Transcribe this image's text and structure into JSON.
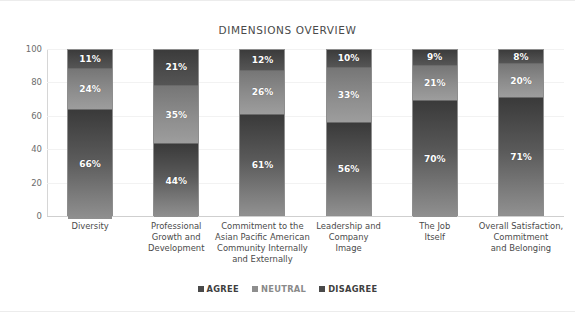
{
  "chart_data": {
    "type": "bar",
    "subtype": "stacked-100-percent-column",
    "title": "DIMENSIONS OVERVIEW",
    "xlabel": "",
    "ylabel": "",
    "ylim": [
      0,
      100
    ],
    "yticks": [
      0,
      20,
      40,
      60,
      80,
      100
    ],
    "grid": true,
    "legend_position": "bottom",
    "categories": [
      "Diversity",
      "Professional Growth and Development",
      "Commitment to the Asian Pacific American Community Internally and Externally",
      "Leadership and Company Image",
      "The Job Itself",
      "Overall Satisfaction, Commitment and Belonging"
    ],
    "category_lines": [
      [
        "Diversity"
      ],
      [
        "Professional",
        "Growth and",
        "Development"
      ],
      [
        "Commitment to the",
        "Asian Pacific American",
        "Community Internally",
        "and Externally"
      ],
      [
        "Leadership and",
        "Company",
        "Image"
      ],
      [
        "The Job",
        "Itself"
      ],
      [
        "Overall Satisfaction,",
        "Commitment",
        "and Belonging"
      ]
    ],
    "series": [
      {
        "name": "AGREE",
        "color": "#5a5a5a",
        "values": [
          66,
          44,
          61,
          56,
          70,
          71
        ],
        "labels": [
          "66%",
          "44%",
          "61%",
          "56%",
          "70%",
          "71%"
        ]
      },
      {
        "name": "NEUTRAL",
        "color": "#8b8b8b",
        "values": [
          24,
          35,
          26,
          33,
          21,
          20
        ],
        "labels": [
          "24%",
          "35%",
          "26%",
          "33%",
          "21%",
          "20%"
        ]
      },
      {
        "name": "DISAGREE",
        "color": "#454545",
        "values": [
          11,
          21,
          12,
          10,
          9,
          8
        ],
        "labels": [
          "11%",
          "21%",
          "12%",
          "10%",
          "9%",
          "8%"
        ]
      }
    ]
  },
  "legend": {
    "items": [
      {
        "label": "AGREE",
        "color": "#4a4a4a"
      },
      {
        "label": "NEUTRAL",
        "color": "#8e8e8e"
      },
      {
        "label": "DISAGREE",
        "color": "#4a4a4a"
      }
    ]
  },
  "axis": {
    "y_ticks": [
      "100",
      "80",
      "60",
      "40",
      "20",
      "0"
    ]
  }
}
